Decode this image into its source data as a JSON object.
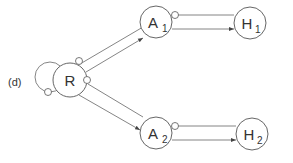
{
  "panel_label": "(d)",
  "nodes": {
    "R": {
      "label": "R",
      "sub": ""
    },
    "A1": {
      "label": "A",
      "sub": "1"
    },
    "H1": {
      "label": "H",
      "sub": "1"
    },
    "A2": {
      "label": "A",
      "sub": "2"
    },
    "H2": {
      "label": "H",
      "sub": "2"
    }
  },
  "edges": [
    {
      "from": "R",
      "to": "R",
      "type": "self-loop-inhibitory"
    },
    {
      "from": "R",
      "to": "A1",
      "type": "activating"
    },
    {
      "from": "A1",
      "to": "R",
      "type": "inhibitory"
    },
    {
      "from": "R",
      "to": "A2",
      "type": "activating"
    },
    {
      "from": "A2",
      "to": "R",
      "type": "inhibitory"
    },
    {
      "from": "A1",
      "to": "H1",
      "type": "activating"
    },
    {
      "from": "H1",
      "to": "A1",
      "type": "inhibitory"
    },
    {
      "from": "A2",
      "to": "H2",
      "type": "activating"
    },
    {
      "from": "H2",
      "to": "A2",
      "type": "inhibitory"
    }
  ]
}
